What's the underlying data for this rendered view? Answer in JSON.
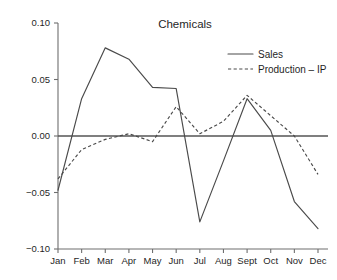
{
  "chart_data": {
    "type": "line",
    "title": "Chemicals",
    "xlabel": "",
    "ylabel": "",
    "categories": [
      "Jan",
      "Feb",
      "Mar",
      "Apr",
      "May",
      "Jun",
      "Jul",
      "Aug",
      "Sept",
      "Oct",
      "Nov",
      "Dec"
    ],
    "ylim": [
      -0.1,
      0.1
    ],
    "yticks": [
      0.1,
      0.05,
      0.0,
      -0.05,
      -0.1
    ],
    "ytick_labels": [
      "0.10",
      "0.05",
      "0.00",
      "-0.05",
      "-0.10"
    ],
    "grid": false,
    "zero_line": true,
    "legend_position": "upper-right",
    "series": [
      {
        "name": "Sales",
        "style": "solid",
        "color": "#4a4a4a",
        "values": [
          -0.048,
          0.033,
          0.078,
          0.068,
          0.043,
          0.042,
          -0.076,
          -0.022,
          0.033,
          0.005,
          -0.058,
          -0.082
        ]
      },
      {
        "name": "Production – IP",
        "style": "dashed",
        "color": "#4a4a4a",
        "values": [
          -0.038,
          -0.012,
          -0.003,
          0.002,
          -0.005,
          0.026,
          0.002,
          0.013,
          0.036,
          0.018,
          0.0,
          -0.034
        ]
      }
    ]
  },
  "title": {
    "text": "Chemicals"
  },
  "legend": {
    "items": [
      {
        "label": "Sales"
      },
      {
        "label": "Production – IP"
      }
    ]
  },
  "y_axis": {
    "labels": [
      "0.10",
      "0.05",
      "0.00",
      "-0.05",
      "-0.10"
    ]
  },
  "x_axis": {
    "labels": [
      "Jan",
      "Feb",
      "Mar",
      "Apr",
      "May",
      "Jun",
      "Jul",
      "Aug",
      "Sept",
      "Oct",
      "Nov",
      "Dec"
    ]
  }
}
